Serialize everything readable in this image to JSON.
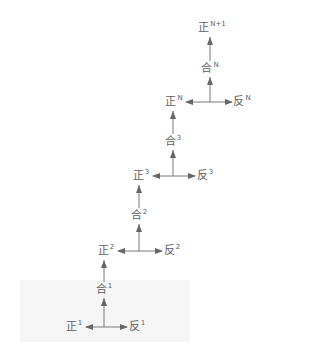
{
  "diagram": {
    "levels": [
      {
        "thesis": {
          "char": "正",
          "sup": "1"
        },
        "antithesis": {
          "char": "反",
          "sup": "1"
        },
        "synthesis": {
          "char": "合",
          "sup": "1"
        }
      },
      {
        "thesis": {
          "char": "正",
          "sup": "2"
        },
        "antithesis": {
          "char": "反",
          "sup": "2"
        },
        "synthesis": {
          "char": "合",
          "sup": "2"
        }
      },
      {
        "thesis": {
          "char": "正",
          "sup": "3"
        },
        "antithesis": {
          "char": "反",
          "sup": "3"
        },
        "synthesis": {
          "char": "合",
          "sup": "3"
        }
      },
      {
        "thesis": {
          "char": "正",
          "sup": "N"
        },
        "antithesis": {
          "char": "反",
          "sup": "N"
        },
        "synthesis": {
          "char": "合",
          "sup": "N"
        }
      }
    ],
    "final": {
      "char": "正",
      "sup": "N+1"
    },
    "colors": {
      "text": "#5e5e5e",
      "arrow": "#7a7a7a",
      "background_box": "#f6f6f6"
    }
  }
}
